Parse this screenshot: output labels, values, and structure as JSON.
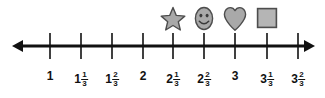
{
  "figure": {
    "type": "number-line",
    "title": "",
    "line": {
      "left_arrow": true,
      "right_arrow": true,
      "left_tip_x": 12,
      "right_tip_x": 315,
      "y": 46,
      "color": "#111111"
    },
    "ticks": [
      {
        "x": 50,
        "whole": "1",
        "num": "",
        "den": "",
        "value": 1.0
      },
      {
        "x": 81,
        "whole": "1",
        "num": "1",
        "den": "3",
        "value": 1.3333
      },
      {
        "x": 112,
        "whole": "1",
        "num": "2",
        "den": "3",
        "value": 1.6667
      },
      {
        "x": 143,
        "whole": "2",
        "num": "",
        "den": "",
        "value": 2.0
      },
      {
        "x": 173,
        "whole": "2",
        "num": "1",
        "den": "3",
        "value": 2.3333
      },
      {
        "x": 204,
        "whole": "2",
        "num": "2",
        "den": "3",
        "value": 2.6667
      },
      {
        "x": 235,
        "whole": "3",
        "num": "",
        "den": "",
        "value": 3.0
      },
      {
        "x": 267,
        "whole": "3",
        "num": "1",
        "den": "3",
        "value": 3.3333
      },
      {
        "x": 298,
        "whole": "3",
        "num": "2",
        "den": "3",
        "value": 3.6667
      }
    ],
    "markers": [
      {
        "icon": "star-icon",
        "x": 173,
        "value": "2 1/3",
        "fill": "#a9a9a9",
        "stroke": "#4d4d4d"
      },
      {
        "icon": "smiley-icon",
        "x": 204,
        "value": "2 2/3",
        "fill": "#a9a9a9",
        "stroke": "#4d4d4d"
      },
      {
        "icon": "heart-icon",
        "x": 235,
        "value": "3",
        "fill": "#a9a9a9",
        "stroke": "#4d4d4d"
      },
      {
        "icon": "square-icon",
        "x": 267,
        "value": "3 1/3",
        "fill": "#b5b5b5",
        "stroke": "#4d4d4d"
      }
    ],
    "colors": {
      "line": "#111111",
      "label": "#111111",
      "shape_fill": "#a9a9a9",
      "shape_stroke": "#4d4d4d",
      "background": "#ffffff"
    }
  },
  "chart_data": {
    "type": "number-line",
    "title": "",
    "xlabel": "",
    "ylabel": "",
    "xlim": [
      1,
      3.6667
    ],
    "tick_labels": [
      "1",
      "1 1/3",
      "1 2/3",
      "2",
      "2 1/3",
      "2 2/3",
      "3",
      "3 1/3",
      "3 2/3"
    ],
    "tick_values": [
      1,
      1.3333,
      1.6667,
      2,
      2.3333,
      2.6667,
      3,
      3.3333,
      3.6667
    ],
    "marked_points": [
      {
        "label": "star",
        "value": 2.3333,
        "value_text": "2 1/3"
      },
      {
        "label": "smiley",
        "value": 2.6667,
        "value_text": "2 2/3"
      },
      {
        "label": "heart",
        "value": 3.0,
        "value_text": "3"
      },
      {
        "label": "square",
        "value": 3.3333,
        "value_text": "3 1/3"
      }
    ],
    "grid": false,
    "legend": "none"
  }
}
